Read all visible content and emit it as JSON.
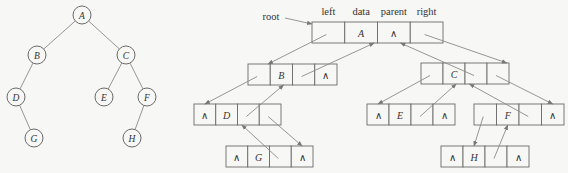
{
  "tree": {
    "nodes": [
      {
        "id": "A",
        "label": "A",
        "x": 82,
        "y": 15
      },
      {
        "id": "B",
        "label": "B",
        "x": 37,
        "y": 55
      },
      {
        "id": "C",
        "label": "C",
        "x": 126,
        "y": 55
      },
      {
        "id": "D",
        "label": "D",
        "x": 16,
        "y": 97
      },
      {
        "id": "E",
        "label": "E",
        "x": 104,
        "y": 97
      },
      {
        "id": "F",
        "label": "F",
        "x": 147,
        "y": 97
      },
      {
        "id": "G",
        "label": "G",
        "x": 34,
        "y": 138
      },
      {
        "id": "H",
        "label": "H",
        "x": 132,
        "y": 138
      }
    ],
    "edges": [
      [
        "A",
        "B"
      ],
      [
        "A",
        "C"
      ],
      [
        "B",
        "D"
      ],
      [
        "C",
        "E"
      ],
      [
        "C",
        "F"
      ],
      [
        "D",
        "G"
      ],
      [
        "F",
        "H"
      ]
    ]
  },
  "linked": {
    "root_label": "root",
    "headers": [
      "left",
      "data",
      "parent",
      "right"
    ],
    "null_symbol": "∧",
    "nodes": [
      {
        "id": "A",
        "data": "A",
        "x": 312,
        "y": 22,
        "cw": 32.75,
        "left": "ptr",
        "parent": "null",
        "right": "ptr"
      },
      {
        "id": "B",
        "data": "B",
        "x": 248,
        "y": 64,
        "cw": 22.25,
        "left": "ptr",
        "parent": "ptr",
        "right": "null"
      },
      {
        "id": "C",
        "data": "C",
        "x": 421,
        "y": 63,
        "cw": 22,
        "left": "ptr",
        "parent": "ptr",
        "right": "ptr"
      },
      {
        "id": "D",
        "data": "D",
        "x": 194,
        "y": 104,
        "cw": 21.75,
        "left": "null",
        "parent": "ptr",
        "right": "ptr"
      },
      {
        "id": "E",
        "data": "E",
        "x": 367,
        "y": 104,
        "cw": 22,
        "left": "null",
        "parent": "ptr",
        "right": "null"
      },
      {
        "id": "F",
        "data": "F",
        "x": 474,
        "y": 104,
        "cw": 22.5,
        "left": "ptr",
        "parent": "ptr",
        "right": "null"
      },
      {
        "id": "G",
        "data": "G",
        "x": 226,
        "y": 146,
        "cw": 21.75,
        "left": "null",
        "parent": "ptr",
        "right": "null"
      },
      {
        "id": "H",
        "data": "H",
        "x": 441,
        "y": 146,
        "cw": 22,
        "left": "null",
        "parent": "ptr",
        "right": "null"
      }
    ],
    "cell_height": 21
  }
}
